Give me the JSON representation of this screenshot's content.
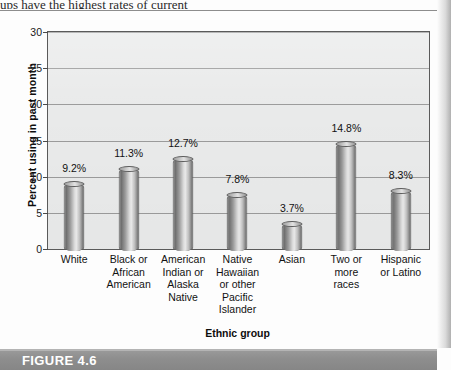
{
  "page": {
    "partial_top_text": "ups have the highest rates of current",
    "figure_caption": "FIGURE 4.6"
  },
  "chart_data": {
    "type": "bar",
    "title": "",
    "xlabel": "Ethnic group",
    "ylabel": "Percent using in past month",
    "ylim": [
      0,
      30
    ],
    "yticks": [
      0,
      5,
      10,
      15,
      20,
      25,
      30
    ],
    "ytick_labels": [
      "0",
      "5",
      "10",
      "15",
      "20",
      "25",
      "30"
    ],
    "grid": "horizontal",
    "legend": "none",
    "categories": [
      "White",
      "Black or African American",
      "American Indian or Alaska Native",
      "Native Hawaiian or other Pacific Islander",
      "Asian",
      "Two or more races",
      "Hispanic or Latino"
    ],
    "category_lines": [
      [
        "White"
      ],
      [
        "Black or",
        "African",
        "American"
      ],
      [
        "American",
        "Indian or",
        "Alaska",
        "Native"
      ],
      [
        "Native",
        "Hawaiian",
        "or other",
        "Pacific",
        "Islander"
      ],
      [
        "Asian"
      ],
      [
        "Two or",
        "more",
        "races"
      ],
      [
        "Hispanic",
        "or Latino"
      ]
    ],
    "values": [
      9.2,
      11.3,
      12.7,
      7.8,
      3.7,
      14.8,
      8.3
    ],
    "value_labels": [
      "9.2%",
      "11.3%",
      "12.7%",
      "7.8%",
      "3.7%",
      "14.8%",
      "8.3%"
    ],
    "colors": {
      "plot_background": "#e9eaea",
      "gridline": "#9b9b9b",
      "axis": "#5a5a5a",
      "bar_light": "#e9e9e9",
      "bar_dark": "#6b6b6b",
      "banner": "#8e8e8e",
      "banner_text": "#ffffff"
    }
  }
}
